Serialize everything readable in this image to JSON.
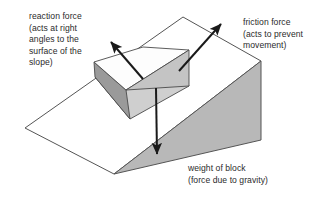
{
  "diagram": {
    "type": "free-body-force-diagram",
    "background_color": "#ffffff",
    "text_color": "#2b2b2b",
    "arrow_color": "#1a1a1a",
    "outline_color": "#555555",
    "labels": {
      "reaction": "reaction force\n(acts at right\nangles to the\nsurface of the\nslope)",
      "friction": "friction force\n(acts to prevent\nmovement)",
      "weight": "weight of block\n(force due to gravity)"
    },
    "forces": [
      {
        "name": "reaction-force",
        "label": "reaction force (acts at right angles to the surface of the slope)",
        "direction": "up-left, perpendicular to slope surface",
        "from": [
          143,
          79
        ],
        "to": [
          109,
          40
        ]
      },
      {
        "name": "friction-force",
        "label": "friction force (acts to prevent movement)",
        "direction": "up the slope, to the upper right",
        "from": [
          179,
          71
        ],
        "to": [
          223,
          22
        ]
      },
      {
        "name": "weight-force",
        "label": "weight of block (force due to gravity)",
        "direction": "vertically downward",
        "from": [
          156,
          88
        ],
        "to": [
          157,
          158
        ]
      }
    ],
    "shapes": {
      "slope_surface": {
        "name": "inclined-plane-surface",
        "fill": "#ffffff",
        "stroke": "#555555",
        "points": "183,17 261,61 114,174 25,128"
      },
      "slope_side_triangle": {
        "name": "slope-side-face",
        "fill": "#b8b8b8",
        "stroke": "#555555",
        "points": "261,61 261,140 114,174"
      },
      "block": {
        "name": "block-on-slope",
        "top_face_fill": "#fdfdfd",
        "front_face_fill": "#cfcfcf",
        "end_face_fill": "#9a9a9a",
        "stroke": "#4a4a4a"
      }
    }
  }
}
